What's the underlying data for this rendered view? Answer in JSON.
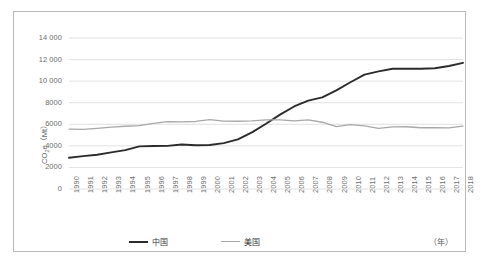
{
  "chart_data": {
    "type": "line",
    "title": "",
    "xlabel": "（年）",
    "ylabel": "CO2e（Mt）",
    "ylabel_base": "CO",
    "ylabel_sub": "2",
    "ylabel_rest": "e（Mt）",
    "x_unit": "（年）",
    "grid": true,
    "legend_position": "bottom",
    "ylim": [
      0,
      14000
    ],
    "ytick_labels": [
      "0",
      "2000",
      "4000",
      "6000",
      "8000",
      "10 000",
      "12 000",
      "14 000"
    ],
    "ytick_values": [
      0,
      2000,
      4000,
      6000,
      8000,
      10000,
      12000,
      14000
    ],
    "categories": [
      "1990",
      "1991",
      "1992",
      "1993",
      "1994",
      "1995",
      "1996",
      "1997",
      "1998",
      "1999",
      "2000",
      "2001",
      "2002",
      "2003",
      "2004",
      "2005",
      "2006",
      "2007",
      "2008",
      "2009",
      "2010",
      "2011",
      "2012",
      "2013",
      "2014",
      "2015",
      "2016",
      "2017",
      "2018"
    ],
    "series": [
      {
        "name": "中国",
        "color": "#2b2b2b",
        "width": 1.9,
        "values": [
          2900,
          3050,
          3180,
          3400,
          3600,
          3950,
          3980,
          4000,
          4120,
          4060,
          4080,
          4250,
          4600,
          5250,
          6050,
          6900,
          7650,
          8200,
          8500,
          9150,
          9900,
          10600,
          10900,
          11150,
          11150,
          11150,
          11200,
          11400,
          11700
        ]
      },
      {
        "name": "美国",
        "color": "#a8a8a8",
        "width": 1.3,
        "values": [
          5560,
          5520,
          5620,
          5740,
          5820,
          5880,
          6080,
          6240,
          6220,
          6260,
          6430,
          6300,
          6280,
          6320,
          6400,
          6400,
          6310,
          6400,
          6190,
          5790,
          5960,
          5860,
          5630,
          5760,
          5770,
          5680,
          5680,
          5670,
          5830
        ]
      }
    ]
  }
}
